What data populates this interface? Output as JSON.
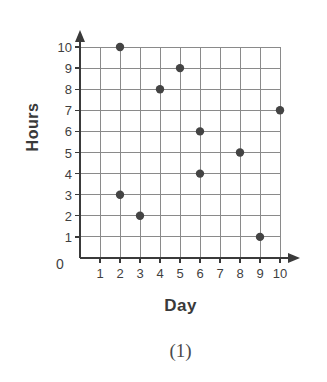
{
  "chart_data": {
    "type": "scatter",
    "title": "",
    "subtitle": "",
    "xlabel": "Day",
    "ylabel": "Hours",
    "caption": "(1)",
    "xlim": [
      0,
      10
    ],
    "ylim": [
      0,
      10
    ],
    "grid": true,
    "legend": "none",
    "x_ticks": [
      "0",
      "1",
      "2",
      "3",
      "4",
      "5",
      "6",
      "7",
      "8",
      "9",
      "10"
    ],
    "y_ticks": [
      "0",
      "1",
      "2",
      "3",
      "4",
      "5",
      "6",
      "7",
      "8",
      "9",
      "10"
    ],
    "y_tick_labels_shown": [
      "10",
      "9",
      "8",
      "7",
      "6",
      "5",
      "4",
      "3",
      "2",
      "1",
      "0"
    ],
    "origin_label": "0",
    "marker_color": "#444444",
    "grid_color": "#8a8a8a",
    "axis_color": "#3a3a3a",
    "points": [
      {
        "x": 2,
        "y": 10
      },
      {
        "x": 5,
        "y": 9
      },
      {
        "x": 4,
        "y": 8
      },
      {
        "x": 10,
        "y": 7
      },
      {
        "x": 6,
        "y": 6
      },
      {
        "x": 8,
        "y": 5
      },
      {
        "x": 6,
        "y": 4
      },
      {
        "x": 2,
        "y": 3
      },
      {
        "x": 3,
        "y": 2
      },
      {
        "x": 9,
        "y": 1
      }
    ]
  }
}
